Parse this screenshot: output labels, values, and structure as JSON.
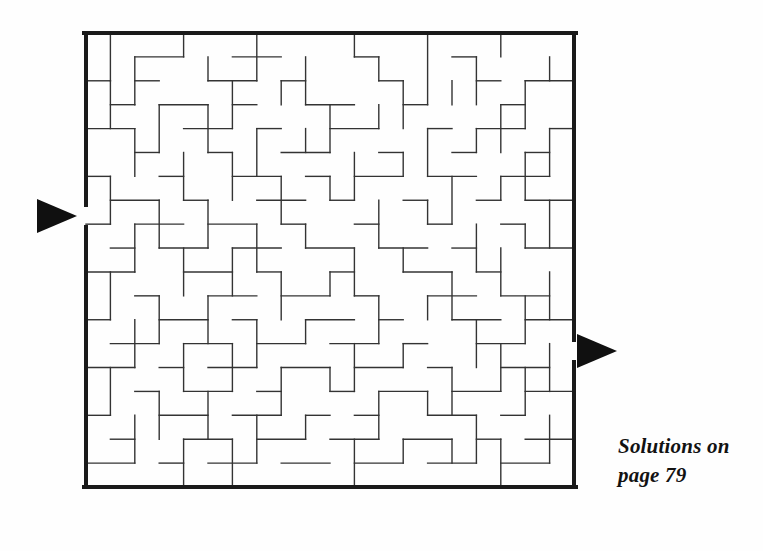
{
  "page": {
    "background_color": "#fefefe",
    "width": 763,
    "height": 551
  },
  "puzzle": {
    "type": "maze",
    "title": "",
    "grid": {
      "cols": 20,
      "rows": 19,
      "cell_px": 24.5
    },
    "frame": {
      "x": 86,
      "y": 33,
      "width": 488,
      "height": 454
    },
    "wall_color": "#1a1a1a",
    "interior_wall_color": "#333333",
    "border_thickness_px": 4,
    "wall_thickness_px": 1.4,
    "entrance": {
      "side": "left",
      "row": 7,
      "gap_y": 205,
      "gap_height": 22,
      "marker": "triangle-right",
      "marker_label": "entrance-arrow"
    },
    "exit": {
      "side": "right",
      "row": 13,
      "gap_y": 340,
      "gap_height": 22,
      "marker": "triangle-right",
      "marker_label": "exit-arrow"
    },
    "arrow_color": "#101010"
  },
  "caption": {
    "line1": "Solutions on",
    "line2": "page 79",
    "color": "#121212"
  },
  "maze_walls": {
    "h": [
      [
        2,
        1,
        4
      ],
      [
        6,
        1,
        8
      ],
      [
        11,
        1,
        12
      ],
      [
        15,
        1,
        16
      ],
      [
        0,
        2,
        1
      ],
      [
        2,
        2,
        3
      ],
      [
        5,
        2,
        7
      ],
      [
        8,
        2,
        9
      ],
      [
        12,
        2,
        13
      ],
      [
        16,
        2,
        17
      ],
      [
        18,
        2,
        20
      ],
      [
        1,
        3,
        2
      ],
      [
        3,
        3,
        5
      ],
      [
        6,
        3,
        7
      ],
      [
        9,
        3,
        11
      ],
      [
        13,
        3,
        14
      ],
      [
        17,
        3,
        18
      ],
      [
        0,
        4,
        2
      ],
      [
        4,
        4,
        6
      ],
      [
        7,
        4,
        8
      ],
      [
        10,
        4,
        12
      ],
      [
        14,
        4,
        15
      ],
      [
        16,
        4,
        18
      ],
      [
        19,
        4,
        20
      ],
      [
        2,
        5,
        3
      ],
      [
        5,
        5,
        6
      ],
      [
        8,
        5,
        10
      ],
      [
        12,
        5,
        13
      ],
      [
        15,
        5,
        16
      ],
      [
        18,
        5,
        19
      ],
      [
        0,
        6,
        1
      ],
      [
        3,
        6,
        4
      ],
      [
        6,
        6,
        8
      ],
      [
        9,
        6,
        10
      ],
      [
        11,
        6,
        13
      ],
      [
        14,
        6,
        16
      ],
      [
        17,
        6,
        19
      ],
      [
        1,
        7,
        3
      ],
      [
        4,
        7,
        5
      ],
      [
        7,
        7,
        9
      ],
      [
        10,
        7,
        11
      ],
      [
        13,
        7,
        14
      ],
      [
        16,
        7,
        17
      ],
      [
        18,
        7,
        20
      ],
      [
        0,
        8,
        1
      ],
      [
        2,
        8,
        4
      ],
      [
        5,
        8,
        7
      ],
      [
        8,
        8,
        9
      ],
      [
        11,
        8,
        12
      ],
      [
        14,
        8,
        15
      ],
      [
        17,
        8,
        18
      ],
      [
        1,
        9,
        2
      ],
      [
        3,
        9,
        5
      ],
      [
        6,
        9,
        8
      ],
      [
        9,
        9,
        11
      ],
      [
        12,
        9,
        14
      ],
      [
        15,
        9,
        16
      ],
      [
        18,
        9,
        20
      ],
      [
        0,
        10,
        2
      ],
      [
        4,
        10,
        6
      ],
      [
        7,
        10,
        8
      ],
      [
        10,
        10,
        11
      ],
      [
        13,
        10,
        15
      ],
      [
        16,
        10,
        17
      ],
      [
        2,
        11,
        3
      ],
      [
        5,
        11,
        7
      ],
      [
        8,
        11,
        10
      ],
      [
        11,
        11,
        12
      ],
      [
        14,
        11,
        16
      ],
      [
        17,
        11,
        19
      ],
      [
        0,
        12,
        1
      ],
      [
        3,
        12,
        5
      ],
      [
        6,
        12,
        7
      ],
      [
        9,
        12,
        11
      ],
      [
        12,
        12,
        13
      ],
      [
        15,
        12,
        17
      ],
      [
        18,
        12,
        20
      ],
      [
        1,
        13,
        3
      ],
      [
        4,
        13,
        6
      ],
      [
        7,
        13,
        9
      ],
      [
        10,
        13,
        12
      ],
      [
        13,
        13,
        14
      ],
      [
        16,
        13,
        18
      ],
      [
        0,
        14,
        2
      ],
      [
        3,
        14,
        4
      ],
      [
        5,
        14,
        7
      ],
      [
        8,
        14,
        10
      ],
      [
        11,
        14,
        13
      ],
      [
        14,
        14,
        15
      ],
      [
        17,
        14,
        19
      ],
      [
        2,
        15,
        3
      ],
      [
        4,
        15,
        6
      ],
      [
        7,
        15,
        8
      ],
      [
        10,
        15,
        11
      ],
      [
        12,
        15,
        14
      ],
      [
        15,
        15,
        17
      ],
      [
        18,
        15,
        20
      ],
      [
        0,
        16,
        1
      ],
      [
        3,
        16,
        5
      ],
      [
        6,
        16,
        8
      ],
      [
        9,
        16,
        10
      ],
      [
        11,
        16,
        12
      ],
      [
        14,
        16,
        16
      ],
      [
        17,
        16,
        18
      ],
      [
        1,
        17,
        2
      ],
      [
        4,
        17,
        6
      ],
      [
        7,
        17,
        9
      ],
      [
        10,
        17,
        12
      ],
      [
        13,
        17,
        15
      ],
      [
        16,
        17,
        17
      ],
      [
        18,
        17,
        20
      ],
      [
        0,
        18,
        2
      ],
      [
        3,
        18,
        4
      ],
      [
        5,
        18,
        7
      ],
      [
        8,
        18,
        10
      ],
      [
        11,
        18,
        13
      ],
      [
        14,
        18,
        16
      ],
      [
        17,
        18,
        19
      ]
    ],
    "v": [
      [
        1,
        0,
        2
      ],
      [
        4,
        0,
        1
      ],
      [
        7,
        0,
        2
      ],
      [
        11,
        0,
        1
      ],
      [
        14,
        0,
        3
      ],
      [
        17,
        0,
        1
      ],
      [
        2,
        1,
        3
      ],
      [
        5,
        1,
        2
      ],
      [
        9,
        1,
        3
      ],
      [
        12,
        1,
        2
      ],
      [
        16,
        1,
        3
      ],
      [
        19,
        1,
        2
      ],
      [
        1,
        2,
        4
      ],
      [
        6,
        2,
        4
      ],
      [
        8,
        2,
        3
      ],
      [
        13,
        2,
        4
      ],
      [
        15,
        2,
        3
      ],
      [
        18,
        2,
        4
      ],
      [
        3,
        3,
        5
      ],
      [
        5,
        3,
        5
      ],
      [
        10,
        3,
        5
      ],
      [
        12,
        3,
        4
      ],
      [
        17,
        3,
        5
      ],
      [
        2,
        4,
        6
      ],
      [
        7,
        4,
        6
      ],
      [
        9,
        4,
        5
      ],
      [
        14,
        4,
        6
      ],
      [
        16,
        4,
        5
      ],
      [
        19,
        4,
        6
      ],
      [
        4,
        5,
        7
      ],
      [
        6,
        5,
        7
      ],
      [
        11,
        5,
        7
      ],
      [
        13,
        5,
        6
      ],
      [
        18,
        5,
        7
      ],
      [
        1,
        6,
        8
      ],
      [
        8,
        6,
        8
      ],
      [
        10,
        6,
        7
      ],
      [
        15,
        6,
        8
      ],
      [
        17,
        6,
        7
      ],
      [
        3,
        7,
        9
      ],
      [
        5,
        7,
        9
      ],
      [
        12,
        7,
        9
      ],
      [
        14,
        7,
        8
      ],
      [
        19,
        7,
        9
      ],
      [
        2,
        8,
        10
      ],
      [
        7,
        8,
        10
      ],
      [
        9,
        8,
        9
      ],
      [
        16,
        8,
        10
      ],
      [
        18,
        8,
        9
      ],
      [
        4,
        9,
        11
      ],
      [
        6,
        9,
        11
      ],
      [
        11,
        9,
        11
      ],
      [
        13,
        9,
        10
      ],
      [
        17,
        9,
        11
      ],
      [
        1,
        10,
        12
      ],
      [
        8,
        10,
        12
      ],
      [
        10,
        10,
        11
      ],
      [
        15,
        10,
        12
      ],
      [
        19,
        10,
        12
      ],
      [
        3,
        11,
        13
      ],
      [
        5,
        11,
        13
      ],
      [
        12,
        11,
        13
      ],
      [
        14,
        11,
        12
      ],
      [
        18,
        11,
        13
      ],
      [
        2,
        12,
        14
      ],
      [
        7,
        12,
        14
      ],
      [
        9,
        12,
        13
      ],
      [
        16,
        12,
        14
      ],
      [
        4,
        13,
        15
      ],
      [
        6,
        13,
        15
      ],
      [
        11,
        13,
        15
      ],
      [
        13,
        13,
        14
      ],
      [
        17,
        13,
        15
      ],
      [
        19,
        13,
        15
      ],
      [
        1,
        14,
        16
      ],
      [
        8,
        14,
        16
      ],
      [
        10,
        14,
        15
      ],
      [
        15,
        14,
        16
      ],
      [
        18,
        14,
        16
      ],
      [
        3,
        15,
        17
      ],
      [
        5,
        15,
        17
      ],
      [
        12,
        15,
        17
      ],
      [
        14,
        15,
        16
      ],
      [
        2,
        16,
        18
      ],
      [
        7,
        16,
        18
      ],
      [
        9,
        16,
        17
      ],
      [
        16,
        16,
        18
      ],
      [
        19,
        16,
        18
      ],
      [
        4,
        17,
        19
      ],
      [
        6,
        17,
        19
      ],
      [
        11,
        17,
        19
      ],
      [
        13,
        17,
        18
      ],
      [
        17,
        17,
        19
      ],
      [
        15,
        17,
        18
      ]
    ]
  }
}
